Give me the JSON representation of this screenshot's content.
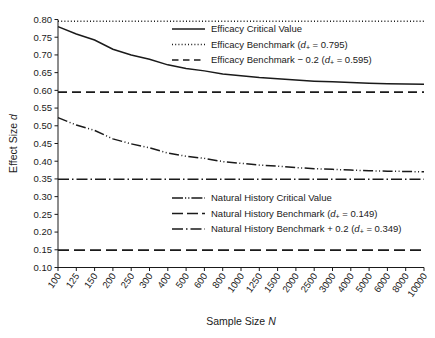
{
  "chart_data": {
    "type": "line",
    "title": "",
    "xlabel": "Sample Size N",
    "ylabel": "Effect Size d",
    "xlabel_text": "Sample Size ",
    "xlabel_italic": "N",
    "ylabel_text": "Effect Size ",
    "ylabel_italic": "d",
    "x_scale": "categorical",
    "grid": false,
    "categories": [
      100,
      125,
      150,
      200,
      250,
      300,
      400,
      500,
      600,
      800,
      1000,
      1250,
      1500,
      2000,
      2500,
      3000,
      4000,
      5000,
      6000,
      8000,
      10000
    ],
    "xtick_labels": [
      "100",
      "125",
      "150",
      "200",
      "250",
      "300",
      "400",
      "500",
      "600",
      "800",
      "1000",
      "1250",
      "1500",
      "2000",
      "2500",
      "3000",
      "4000",
      "5000",
      "6000",
      "8000",
      "10000"
    ],
    "ylim": [
      0.1,
      0.8
    ],
    "yticks": [
      0.1,
      0.15,
      0.2,
      0.25,
      0.3,
      0.35,
      0.4,
      0.45,
      0.5,
      0.55,
      0.6,
      0.65,
      0.7,
      0.75,
      0.8
    ],
    "ytick_labels": [
      "0.10",
      "0.15",
      "0.20",
      "0.25",
      "0.30",
      "0.35",
      "0.40",
      "0.45",
      "0.50",
      "0.55",
      "0.60",
      "0.65",
      "0.70",
      "0.75",
      "0.80"
    ],
    "series": [
      {
        "name": "Efficacy Critical Value",
        "style": "solid",
        "dasharray": "",
        "width": 1.5,
        "color": "#1a1a1a",
        "values": [
          0.78,
          0.759,
          0.742,
          0.716,
          0.7,
          0.688,
          0.672,
          0.662,
          0.655,
          0.646,
          0.641,
          0.636,
          0.633,
          0.629,
          0.626,
          0.624,
          0.622,
          0.62,
          0.619,
          0.618,
          0.617
        ]
      },
      {
        "name": "Efficacy Benchmark",
        "style": "dotted",
        "dasharray": "1,2.2",
        "width": 1.3,
        "color": "#1a1a1a",
        "constant": 0.795
      },
      {
        "name": "Efficacy Benchmark - 0.2",
        "style": "dashed",
        "dasharray": "9,5",
        "width": 1.6,
        "color": "#1a1a1a",
        "constant": 0.595
      },
      {
        "name": "Natural History Critical Value",
        "style": "dash-dot-dot",
        "dasharray": "10,2.5,1,2.5,1,2.5",
        "width": 1.5,
        "color": "#1a1a1a",
        "values": [
          0.523,
          0.502,
          0.487,
          0.463,
          0.449,
          0.438,
          0.423,
          0.414,
          0.408,
          0.399,
          0.394,
          0.389,
          0.386,
          0.382,
          0.379,
          0.377,
          0.375,
          0.373,
          0.372,
          0.371,
          0.37
        ]
      },
      {
        "name": "Natural History Benchmark",
        "style": "long-dash",
        "dasharray": "11,5",
        "width": 1.6,
        "color": "#1a1a1a",
        "constant": 0.149
      },
      {
        "name": "Natural History Benchmark + 0.2",
        "style": "dash-dot",
        "dasharray": "11,3,1.5,3",
        "width": 1.6,
        "color": "#1a1a1a",
        "constant": 0.349
      }
    ],
    "legends": [
      {
        "position": "upper-right",
        "entries": [
          {
            "label": "Efficacy Critical Value",
            "label_pre": "Efficacy Critical Value",
            "has_value": false,
            "value": "",
            "style": "solid",
            "dasharray": "",
            "width": 1.5
          },
          {
            "label": "Efficacy Benchmark (d+ = 0.795)",
            "label_pre": "Efficacy Benchmark (",
            "has_value": true,
            "value": "0.795",
            "style": "dotted",
            "dasharray": "1,2.2",
            "width": 1.3
          },
          {
            "label": "Efficacy Benchmark - 0.2 (d+ = 0.595)",
            "label_pre": "Efficacy Benchmark − 0.2 (",
            "has_value": true,
            "value": "0.595",
            "style": "dashed",
            "dasharray": "6.5,4.5",
            "width": 1.6
          }
        ]
      },
      {
        "position": "middle-right",
        "entries": [
          {
            "label": "Natural History Critical Value",
            "label_pre": "Natural History Critical Value",
            "has_value": false,
            "value": "",
            "style": "dash-dot-dot",
            "dasharray": "11,2,1.2,2,1.2,2",
            "width": 1.5
          },
          {
            "label": "Natural History Benchmark (d+ = 0.149)",
            "label_pre": "Natural History Benchmark (",
            "has_value": true,
            "value": "0.149",
            "style": "long-dash",
            "dasharray": "11,4",
            "width": 1.6
          },
          {
            "label": "Natural History Benchmark + 0.2 (d+ = 0.349)",
            "label_pre": "Natural History Benchmark + 0.2 (",
            "has_value": true,
            "value": "0.349",
            "style": "dash-dot",
            "dasharray": "11,3,1.5,3",
            "width": 1.6
          }
        ]
      }
    ],
    "legend_symbol_d": "d",
    "legend_symbol_sub": "+",
    "legend_equals": " = ",
    "legend_close": ")"
  }
}
